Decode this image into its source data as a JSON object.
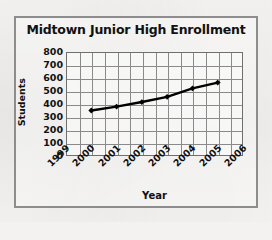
{
  "chart_data": {
    "type": "line",
    "title": "Midtown Junior High Enrollment",
    "xlabel": "Year",
    "ylabel": "Students",
    "x": [
      2000,
      2001,
      2002,
      2003,
      2004,
      2005
    ],
    "values": [
      350,
      380,
      415,
      455,
      520,
      565
    ],
    "series": [
      {
        "name": "Enrollment",
        "values": [
          350,
          380,
          415,
          455,
          520,
          565
        ]
      }
    ],
    "x_tick_labels": [
      "1999",
      "2000",
      "2001",
      "2002",
      "2003",
      "2004",
      "2005",
      "2006"
    ],
    "y_tick_labels": [
      "800",
      "700",
      "600",
      "500",
      "400",
      "300",
      "200",
      "100",
      "0"
    ],
    "xlim": [
      1999,
      2006
    ],
    "ylim": [
      0,
      800
    ],
    "y_tick_step": 100,
    "grid": true,
    "legend": "none",
    "marker": "diamond",
    "line_color": "#000000",
    "grid_color": "#8a8a8a",
    "axis_color": "#6f6f6f",
    "text_color": "#111111",
    "x_tick_rotation": -45
  }
}
